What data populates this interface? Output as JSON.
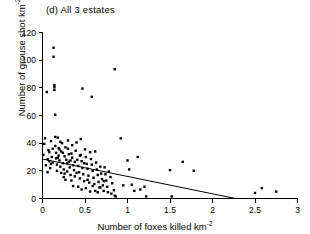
{
  "figure": {
    "panel_label": "(d) All 3 estates",
    "background": "#ffffff",
    "foreground": "#000000"
  },
  "axes": {
    "x_title_main": "Number of foxes killed km",
    "x_title_exp": "-2",
    "y_title_main": "Number of grouse shot km",
    "y_title_exp": "-2",
    "x_ticks": [
      "0",
      "0.5",
      "1",
      "1.5",
      "2",
      "2.5",
      "3"
    ],
    "y_ticks": [
      "0",
      "20",
      "40",
      "60",
      "80",
      "100",
      "120"
    ]
  },
  "chart_data": {
    "type": "scatter",
    "title": "(d) All 3 estates",
    "xlabel": "Number of foxes killed km-2",
    "ylabel": "Number of grouse shot km-2",
    "xlim": [
      0,
      3
    ],
    "ylim": [
      0,
      120
    ],
    "xticks": [
      0,
      0.5,
      1,
      1.5,
      2,
      2.5,
      3
    ],
    "yticks": [
      0,
      20,
      40,
      60,
      80,
      100,
      120
    ],
    "grid": false,
    "legend": "none",
    "marker": "filled-square",
    "marker_color": "#000000",
    "series": [
      {
        "name": "All 3 estates",
        "points": [
          [
            0.01,
            31.5
          ],
          [
            0.02,
            39.5
          ],
          [
            0.03,
            43.5
          ],
          [
            0.04,
            24.0
          ],
          [
            0.05,
            77.0
          ],
          [
            0.06,
            28.5
          ],
          [
            0.07,
            35.0
          ],
          [
            0.08,
            27.0
          ],
          [
            0.09,
            22.0
          ],
          [
            0.1,
            41.5
          ],
          [
            0.11,
            30.0
          ],
          [
            0.12,
            26.0
          ],
          [
            0.13,
            109.0
          ],
          [
            0.13,
            102.5
          ],
          [
            0.14,
            82.0
          ],
          [
            0.14,
            80.5
          ],
          [
            0.14,
            78.5
          ],
          [
            0.15,
            60.5
          ],
          [
            0.15,
            38.0
          ],
          [
            0.16,
            33.0
          ],
          [
            0.16,
            29.0
          ],
          [
            0.17,
            24.5
          ],
          [
            0.17,
            20.0
          ],
          [
            0.18,
            44.0
          ],
          [
            0.19,
            36.5
          ],
          [
            0.19,
            31.0
          ],
          [
            0.2,
            27.5
          ],
          [
            0.21,
            23.0
          ],
          [
            0.22,
            18.5
          ],
          [
            0.22,
            34.0
          ],
          [
            0.23,
            40.0
          ],
          [
            0.24,
            25.5
          ],
          [
            0.25,
            21.0
          ],
          [
            0.25,
            15.5
          ],
          [
            0.26,
            30.5
          ],
          [
            0.27,
            37.0
          ],
          [
            0.28,
            28.0
          ],
          [
            0.29,
            19.5
          ],
          [
            0.3,
            42.0
          ],
          [
            0.3,
            36.0
          ],
          [
            0.31,
            26.5
          ],
          [
            0.32,
            22.5
          ],
          [
            0.33,
            17.0
          ],
          [
            0.34,
            32.5
          ],
          [
            0.35,
            38.5
          ],
          [
            0.35,
            29.5
          ],
          [
            0.36,
            24.0
          ],
          [
            0.37,
            20.5
          ],
          [
            0.38,
            16.0
          ],
          [
            0.39,
            34.5
          ],
          [
            0.4,
            40.5
          ],
          [
            0.41,
            28.0
          ],
          [
            0.42,
            23.5
          ],
          [
            0.43,
            19.0
          ],
          [
            0.44,
            14.5
          ],
          [
            0.45,
            43.0
          ],
          [
            0.45,
            31.5
          ],
          [
            0.46,
            27.0
          ],
          [
            0.47,
            22.0
          ],
          [
            0.47,
            79.5
          ],
          [
            0.48,
            17.5
          ],
          [
            0.49,
            12.5
          ],
          [
            0.5,
            35.5
          ],
          [
            0.51,
            30.0
          ],
          [
            0.52,
            25.0
          ],
          [
            0.53,
            21.5
          ],
          [
            0.54,
            16.5
          ],
          [
            0.55,
            11.5
          ],
          [
            0.56,
            33.5
          ],
          [
            0.57,
            28.5
          ],
          [
            0.58,
            24.5
          ],
          [
            0.58,
            73.5
          ],
          [
            0.59,
            20.0
          ],
          [
            0.6,
            15.0
          ],
          [
            0.61,
            10.5
          ],
          [
            0.62,
            34.0
          ],
          [
            0.63,
            26.0
          ],
          [
            0.64,
            21.0
          ],
          [
            0.65,
            17.0
          ],
          [
            0.66,
            12.0
          ],
          [
            0.67,
            8.0
          ],
          [
            0.68,
            23.0
          ],
          [
            0.69,
            18.0
          ],
          [
            0.7,
            14.0
          ],
          [
            0.71,
            9.5
          ],
          [
            0.72,
            5.5
          ],
          [
            0.73,
            22.5
          ],
          [
            0.74,
            17.5
          ],
          [
            0.75,
            13.0
          ],
          [
            0.76,
            8.5
          ],
          [
            0.78,
            19.5
          ],
          [
            0.8,
            15.5
          ],
          [
            0.82,
            11.0
          ],
          [
            0.84,
            6.0
          ],
          [
            0.85,
            93.5
          ],
          [
            0.85,
            2.0
          ],
          [
            0.86,
            1.5
          ],
          [
            0.92,
            43.5
          ],
          [
            0.95,
            9.5
          ],
          [
            1.0,
            27.5
          ],
          [
            1.02,
            21.0
          ],
          [
            1.05,
            10.0
          ],
          [
            1.08,
            5.5
          ],
          [
            1.12,
            30.0
          ],
          [
            1.15,
            6.5
          ],
          [
            1.2,
            8.5
          ],
          [
            1.22,
            1.5
          ],
          [
            1.5,
            20.5
          ],
          [
            1.52,
            1.5
          ],
          [
            1.65,
            26.5
          ],
          [
            1.78,
            20.0
          ],
          [
            2.5,
            4.0
          ],
          [
            2.58,
            7.5
          ],
          [
            2.75,
            5.0
          ],
          [
            0.06,
            19.0
          ],
          [
            0.08,
            33.5
          ],
          [
            0.1,
            25.0
          ],
          [
            0.12,
            36.0
          ],
          [
            0.15,
            44.5
          ],
          [
            0.18,
            29.5
          ],
          [
            0.2,
            35.5
          ],
          [
            0.21,
            41.0
          ],
          [
            0.24,
            33.0
          ],
          [
            0.26,
            18.0
          ],
          [
            0.27,
            13.5
          ],
          [
            0.29,
            25.5
          ],
          [
            0.31,
            32.0
          ],
          [
            0.33,
            27.5
          ],
          [
            0.34,
            13.0
          ],
          [
            0.36,
            9.0
          ],
          [
            0.38,
            26.5
          ],
          [
            0.4,
            18.5
          ],
          [
            0.42,
            8.5
          ],
          [
            0.44,
            31.0
          ],
          [
            0.46,
            6.5
          ],
          [
            0.49,
            25.5
          ],
          [
            0.51,
            7.5
          ],
          [
            0.53,
            13.5
          ],
          [
            0.56,
            5.0
          ],
          [
            0.59,
            9.0
          ],
          [
            0.62,
            5.5
          ],
          [
            0.65,
            4.5
          ],
          [
            0.68,
            8.0
          ],
          [
            0.72,
            12.5
          ],
          [
            0.77,
            4.5
          ],
          [
            0.81,
            3.5
          ]
        ]
      }
    ],
    "fit_line": {
      "name": "linear regression",
      "x_start": 0.0,
      "y_start": 28.5,
      "x_end": 2.27,
      "y_end": 0.0
    }
  }
}
